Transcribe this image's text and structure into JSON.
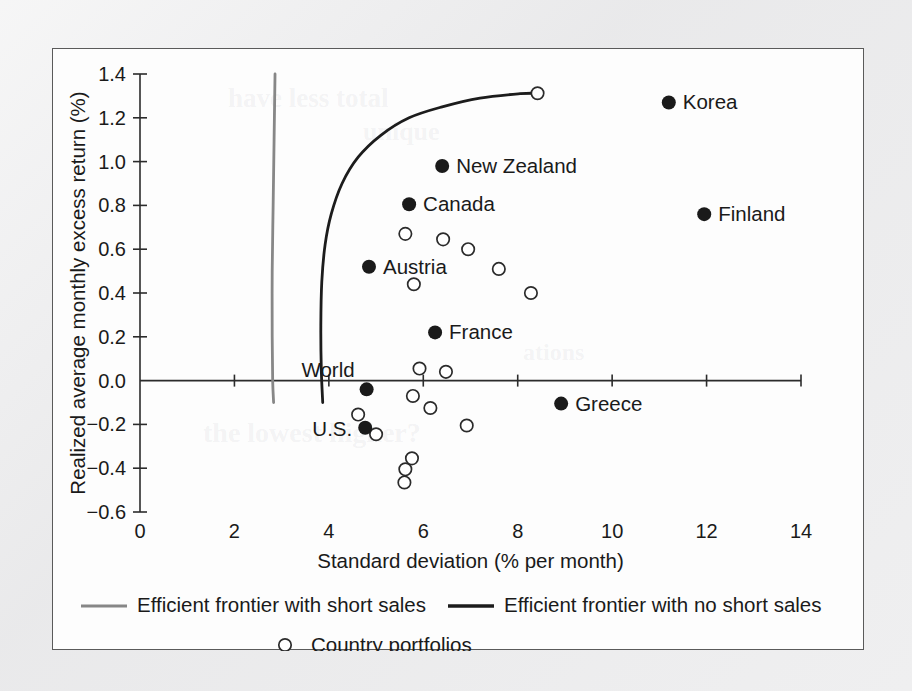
{
  "chart_data": {
    "type": "scatter",
    "title": "",
    "xlabel": "Standard deviation (% per month)",
    "ylabel": "Realized average monthly excess return (%)",
    "xlim": [
      0,
      14
    ],
    "ylim": [
      -0.6,
      1.4
    ],
    "xticks": [
      0,
      2,
      4,
      6,
      8,
      10,
      12,
      14
    ],
    "xtick_labels": [
      "0",
      "2",
      "4",
      "6",
      "8",
      "10",
      "12",
      "14"
    ],
    "yticks": [
      -0.6,
      -0.4,
      -0.2,
      0.0,
      0.2,
      0.4,
      0.6,
      0.8,
      1.0,
      1.2,
      1.4
    ],
    "ytick_labels": [
      "−0.6",
      "−0.4",
      "−0.2",
      "0.0",
      "0.2",
      "0.4",
      "0.6",
      "0.8",
      "1.0",
      "1.2",
      "1.4"
    ],
    "grid": false,
    "legend_position": "below-axes",
    "series": [
      {
        "name": "Efficient frontier with short sales",
        "type": "line",
        "color": "#878787",
        "points": [
          [
            2.86,
            1.4
          ],
          [
            2.84,
            1.1
          ],
          [
            2.82,
            0.8
          ],
          [
            2.8,
            0.5
          ],
          [
            2.8,
            0.2
          ],
          [
            2.81,
            0.0
          ],
          [
            2.83,
            -0.1
          ]
        ]
      },
      {
        "name": "Efficient frontier with no short sales",
        "type": "line",
        "color": "#1c1c1c",
        "points": [
          [
            3.87,
            -0.1
          ],
          [
            3.84,
            0.05
          ],
          [
            3.83,
            0.25
          ],
          [
            3.85,
            0.45
          ],
          [
            3.92,
            0.62
          ],
          [
            4.05,
            0.76
          ],
          [
            4.28,
            0.9
          ],
          [
            4.62,
            1.02
          ],
          [
            5.1,
            1.12
          ],
          [
            5.7,
            1.2
          ],
          [
            6.4,
            1.25
          ],
          [
            7.2,
            1.29
          ],
          [
            8.05,
            1.31
          ],
          [
            8.42,
            1.312
          ]
        ]
      },
      {
        "name": "Labeled country portfolios",
        "type": "scatter",
        "marker": "filled-circle",
        "color": "#1a1a1a",
        "points": [
          {
            "label": "Korea",
            "x": 11.2,
            "y": 1.27,
            "label_side": "right"
          },
          {
            "label": "Finland",
            "x": 11.95,
            "y": 0.76,
            "label_side": "right"
          },
          {
            "label": "New Zealand",
            "x": 6.4,
            "y": 0.98,
            "label_side": "right"
          },
          {
            "label": "Canada",
            "x": 5.7,
            "y": 0.805,
            "label_side": "right"
          },
          {
            "label": "Austria",
            "x": 4.85,
            "y": 0.52,
            "label_side": "right"
          },
          {
            "label": "France",
            "x": 6.25,
            "y": 0.22,
            "label_side": "right"
          },
          {
            "label": "Greece",
            "x": 8.92,
            "y": -0.105,
            "label_side": "right"
          },
          {
            "label": "World",
            "x": 4.8,
            "y": -0.04,
            "label_side": "above-left"
          },
          {
            "label": "U.S.",
            "x": 4.77,
            "y": -0.215,
            "label_side": "left"
          }
        ]
      },
      {
        "name": "Country portfolios",
        "type": "scatter",
        "marker": "open-circle",
        "color": "#2b2b2b",
        "points": [
          {
            "x": 5.62,
            "y": 0.67
          },
          {
            "x": 6.42,
            "y": 0.645
          },
          {
            "x": 6.95,
            "y": 0.6
          },
          {
            "x": 7.6,
            "y": 0.51
          },
          {
            "x": 8.42,
            "y": 1.312
          },
          {
            "x": 8.28,
            "y": 0.4
          },
          {
            "x": 5.8,
            "y": 0.44
          },
          {
            "x": 5.92,
            "y": 0.055
          },
          {
            "x": 6.48,
            "y": 0.04
          },
          {
            "x": 5.78,
            "y": -0.07
          },
          {
            "x": 6.15,
            "y": -0.125
          },
          {
            "x": 6.92,
            "y": -0.205
          },
          {
            "x": 4.62,
            "y": -0.155
          },
          {
            "x": 5.0,
            "y": -0.245
          },
          {
            "x": 5.76,
            "y": -0.355
          },
          {
            "x": 5.62,
            "y": -0.405
          },
          {
            "x": 5.6,
            "y": -0.465
          }
        ]
      }
    ],
    "legend": [
      {
        "label": "Efficient frontier with short sales",
        "marker": "line",
        "color": "#878787"
      },
      {
        "label": "Efficient frontier with no short sales",
        "marker": "line",
        "color": "#1c1c1c"
      },
      {
        "label": "Country portfolios",
        "marker": "open-circle",
        "color": "#2b2b2b"
      }
    ]
  },
  "ghost_text": {
    "a": "have less total",
    "b": "unique",
    "c": "the lowest higher?",
    "d": "ations"
  }
}
